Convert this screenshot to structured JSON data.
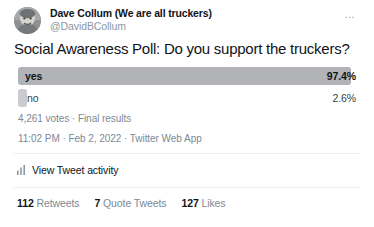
{
  "tweet": {
    "author": {
      "display_name": "Dave Collum (We are all truckers)",
      "handle": "@DavidBCollum",
      "avatar_icon": "user-avatar-photo"
    },
    "more_options_icon": "…",
    "text": "Social Awareness Poll: Do you support the truckers?",
    "poll": {
      "options": [
        {
          "label": "yes",
          "percent_label": "97.4%",
          "percent": 97.4,
          "winner": true
        },
        {
          "label": "no",
          "percent_label": "2.6%",
          "percent": 2.6,
          "winner": false
        }
      ],
      "meta": "4,261 votes · Final results",
      "total_votes": 4261
    },
    "timestamp": "11:02 PM · Feb 2, 2022 · Twitter Web App",
    "activity": {
      "icon": "bar-chart-icon",
      "label": "View Tweet activity"
    },
    "stats": [
      {
        "count": "112",
        "label": "Retweets"
      },
      {
        "count": "7",
        "label": "Quote Tweets"
      },
      {
        "count": "127",
        "label": "Likes"
      }
    ]
  },
  "colors": {
    "text": "#0f1419",
    "muted": "#7d8996",
    "bar_winner": "#b1b3b6",
    "bar_loser": "#c9cbce",
    "divider": "#eceef0",
    "background": "#ffffff"
  }
}
